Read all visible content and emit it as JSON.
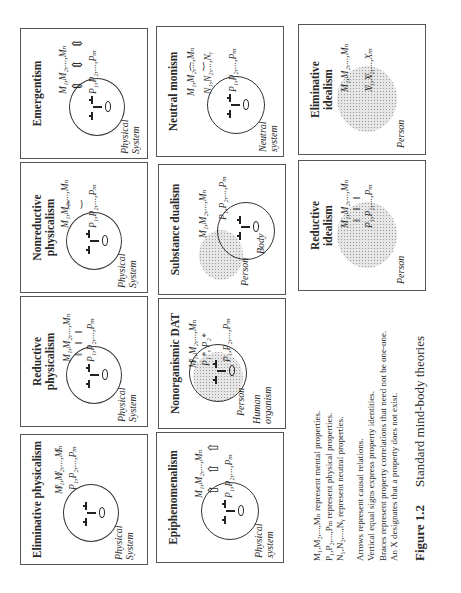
{
  "figure": {
    "number": "Figure 1.2",
    "caption": "Standard mind-body theories"
  },
  "panels": [
    {
      "title": "Eliminative physicalism",
      "system_label": "Physical System",
      "mental_row": "M̸₁,M̸₂,...,M̸ₙ",
      "physical_row": "P₁,P₂,...,Pₘ",
      "relation": "none (X-ed out mental properties)"
    },
    {
      "title": "Reductive physicalism",
      "system_label": "Physical System",
      "mental_row": "M₁,M₂,...,Mₙ",
      "physical_row": "P₁,P₂,...,Pₘ",
      "relation": "‖ ‖ ‖"
    },
    {
      "title": "Nonreductive physicalism",
      "system_label": "Physical System",
      "mental_row": "M₁,M₂,...,Mₙ",
      "physical_row": "P₁,P₂,...,Pₘ",
      "relation": "{ }"
    },
    {
      "title": "Emergentism",
      "system_label": "Physical System",
      "mental_row": "M₁,M₂,...,Mₙ",
      "physical_row": "P₁,P₂,...,Pₘ",
      "relation": "⇕ ⇕ ⇕"
    },
    {
      "title": "Epiphenomenalism",
      "system_label": "Physical system",
      "mental_row": "M₁,M₂,...,Mₙ",
      "physical_row": "P₁,P₂,...,Pₘ",
      "relation": "⇧ ⇧ ⇧"
    },
    {
      "title": "Nonorganismic DAT",
      "person_label": "Person",
      "body_label": "Human organism",
      "mental_row": "M̸₁,M₂,...,Mₙ",
      "mid_row": "P₁*, P₂*",
      "physical_row": "P₁,P₂,...,Pₘ"
    },
    {
      "title": "Substance dualism",
      "person_label": "Person",
      "body_label": "Body",
      "mental_row": "M₁,M₂,...,Mₙ",
      "physical_row": "P₁,P₂,...,Pₘ"
    },
    {
      "title": "Neutral monism",
      "system_label": "Neutral system",
      "mental_row": "M₁,M₂,...,Mₙ",
      "neutral_row": "N₁,N₂,...,Nᵧ",
      "physical_row": "P₁,P₂,...,Pₘ",
      "relation": "{ }"
    },
    {
      "title": "Reductive idealism",
      "person_label": "Person",
      "mental_row": "M₁,M₂,...,Mₙ",
      "physical_row": "P₁,P₂,...,Pₘ",
      "relation": "‖ ‖ ‖"
    },
    {
      "title": "Eliminative idealism",
      "person_label": "Person",
      "mental_row": "M₁,M₂,...,Mₙ",
      "physical_row": "X̸₁,X̸₂,...,Xₘ"
    }
  ],
  "legend": [
    "M₁,M₂,...,Mₙ represent mental properties.",
    "P₁,P₂,...,Pₘ represent physical properties.",
    "N₁,N₂,...,Nᵧ represent neutral properties.",
    "Arrows represent causal relations.",
    "Vertical equal signs express property identities.",
    "Braces represent property correlations that need not be one-one.",
    "An X designates that a property does not exist."
  ]
}
